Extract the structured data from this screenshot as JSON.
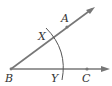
{
  "diagram": {
    "type": "geometry-angle-bisector-construction",
    "points": {
      "A": {
        "label": "A"
      },
      "B": {
        "label": "B"
      },
      "C": {
        "label": "C"
      },
      "X": {
        "label": "X"
      },
      "Y": {
        "label": "Y"
      }
    },
    "colors": {
      "ray": "#777777",
      "arc": "#555555",
      "text": "#333333"
    }
  }
}
